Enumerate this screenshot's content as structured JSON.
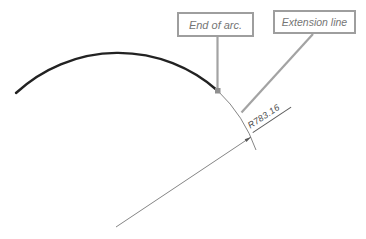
{
  "diagram": {
    "callouts": [
      {
        "label": "End of arc."
      },
      {
        "label": "Extension line"
      }
    ],
    "dimension": {
      "label": "R783.16"
    },
    "colors": {
      "arc_stroke": "#222222",
      "thin_line": "#777777",
      "leader_line": "#a3a3a3",
      "box_border": "#9e9e9e",
      "box_text": "#757575",
      "dimension_text": "#4a4a4a",
      "marker_fill": "#8f8f8f",
      "background": "#ffffff"
    }
  }
}
